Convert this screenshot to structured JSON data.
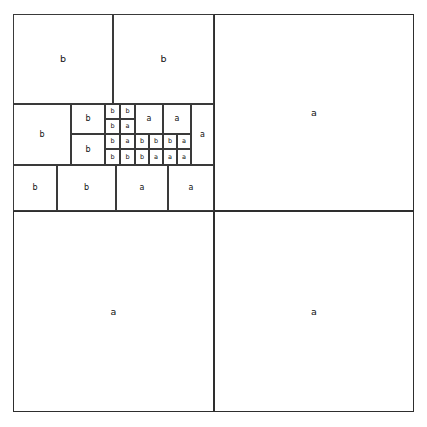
{
  "figure": {
    "caption": "",
    "stroke_color": "#3a3a3a",
    "background_color": "#ffffff",
    "label_color": "#111111",
    "canvas": {
      "width": 427,
      "height": 427
    },
    "board": {
      "x": 13,
      "y": 14,
      "width": 401,
      "height": 398
    }
  },
  "chart_data": {
    "type": "table",
    "xlabel": "",
    "ylabel": "",
    "grid": false,
    "legend": [],
    "labels_used": [
      "a",
      "b"
    ],
    "label_counts": {
      "a": 16,
      "b": 19
    },
    "cell_count": 35,
    "cells": [
      {
        "id": "c01",
        "label": "b",
        "x": 0,
        "y": 0,
        "w": 100,
        "h": 90,
        "size": "large"
      },
      {
        "id": "c02",
        "label": "b",
        "x": 100,
        "y": 0,
        "w": 101,
        "h": 90,
        "size": "large"
      },
      {
        "id": "c03",
        "label": "a",
        "x": 201,
        "y": 0,
        "w": 200,
        "h": 197,
        "size": "large"
      },
      {
        "id": "c04",
        "label": "b",
        "x": 0,
        "y": 90,
        "w": 58,
        "h": 61,
        "size": "small"
      },
      {
        "id": "c05",
        "label": "b",
        "x": 58,
        "y": 90,
        "w": 34,
        "h": 30,
        "size": "small"
      },
      {
        "id": "c06",
        "label": "b",
        "x": 58,
        "y": 120,
        "w": 34,
        "h": 31,
        "size": "small"
      },
      {
        "id": "c07",
        "label": "b",
        "x": 92,
        "y": 90,
        "w": 15,
        "h": 15,
        "size": "tiny"
      },
      {
        "id": "c08",
        "label": "b",
        "x": 107,
        "y": 90,
        "w": 15,
        "h": 15,
        "size": "tiny"
      },
      {
        "id": "c09",
        "label": "b",
        "x": 92,
        "y": 105,
        "w": 15,
        "h": 15,
        "size": "tiny"
      },
      {
        "id": "c10",
        "label": "a",
        "x": 107,
        "y": 105,
        "w": 15,
        "h": 15,
        "size": "tiny"
      },
      {
        "id": "c11",
        "label": "b",
        "x": 92,
        "y": 120,
        "w": 15,
        "h": 15,
        "size": "tiny"
      },
      {
        "id": "c12",
        "label": "a",
        "x": 107,
        "y": 120,
        "w": 15,
        "h": 15,
        "size": "tiny"
      },
      {
        "id": "c13",
        "label": "b",
        "x": 92,
        "y": 135,
        "w": 15,
        "h": 16,
        "size": "tiny"
      },
      {
        "id": "c14",
        "label": "b",
        "x": 107,
        "y": 135,
        "w": 15,
        "h": 16,
        "size": "tiny"
      },
      {
        "id": "c15",
        "label": "a",
        "x": 122,
        "y": 90,
        "w": 28,
        "h": 30,
        "size": "small"
      },
      {
        "id": "c16",
        "label": "a",
        "x": 150,
        "y": 90,
        "w": 28,
        "h": 30,
        "size": "small"
      },
      {
        "id": "c17",
        "label": "b",
        "x": 122,
        "y": 120,
        "w": 14,
        "h": 15,
        "size": "tiny"
      },
      {
        "id": "c18",
        "label": "b",
        "x": 136,
        "y": 120,
        "w": 14,
        "h": 15,
        "size": "tiny"
      },
      {
        "id": "c19",
        "label": "b",
        "x": 150,
        "y": 120,
        "w": 14,
        "h": 15,
        "size": "tiny"
      },
      {
        "id": "c20",
        "label": "a",
        "x": 164,
        "y": 120,
        "w": 14,
        "h": 15,
        "size": "tiny"
      },
      {
        "id": "c21",
        "label": "b",
        "x": 122,
        "y": 135,
        "w": 14,
        "h": 16,
        "size": "tiny"
      },
      {
        "id": "c22",
        "label": "a",
        "x": 136,
        "y": 135,
        "w": 14,
        "h": 16,
        "size": "tiny"
      },
      {
        "id": "c23",
        "label": "a",
        "x": 150,
        "y": 135,
        "w": 14,
        "h": 16,
        "size": "tiny"
      },
      {
        "id": "c24",
        "label": "a",
        "x": 164,
        "y": 135,
        "w": 14,
        "h": 16,
        "size": "tiny"
      },
      {
        "id": "c25",
        "label": "a",
        "x": 178,
        "y": 90,
        "w": 23,
        "h": 61,
        "size": "small"
      },
      {
        "id": "c26",
        "label": "b",
        "x": 0,
        "y": 151,
        "w": 44,
        "h": 46,
        "size": "small"
      },
      {
        "id": "c27",
        "label": "b",
        "x": 44,
        "y": 151,
        "w": 59,
        "h": 46,
        "size": "small"
      },
      {
        "id": "c28",
        "label": "a",
        "x": 103,
        "y": 151,
        "w": 52,
        "h": 46,
        "size": "small"
      },
      {
        "id": "c29",
        "label": "a",
        "x": 155,
        "y": 151,
        "w": 46,
        "h": 46,
        "size": "small"
      },
      {
        "id": "c30",
        "label": "a",
        "x": 0,
        "y": 197,
        "w": 201,
        "h": 201,
        "size": "large"
      },
      {
        "id": "c31",
        "label": "a",
        "x": 201,
        "y": 197,
        "w": 200,
        "h": 201,
        "size": "large"
      }
    ]
  }
}
